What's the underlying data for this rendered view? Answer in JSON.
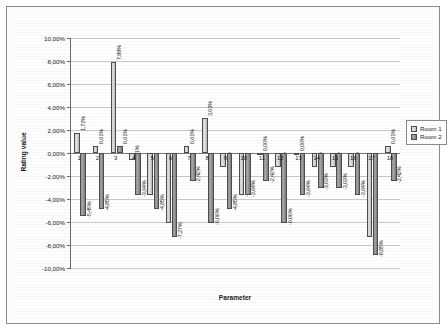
{
  "chart_data": {
    "type": "bar",
    "title": "",
    "xlabel": "Parameter",
    "ylabel": "Rating value",
    "ylim": [
      -10,
      10
    ],
    "ytick_labels": [
      "10,00%",
      "8,00%",
      "6,00%",
      "4,00%",
      "2,00%",
      "0,00%",
      "-2,00%",
      "-4,00%",
      "-6,00%",
      "-8,00%",
      "-10,00%"
    ],
    "ytick_values": [
      10,
      8,
      6,
      4,
      2,
      0,
      -2,
      -4,
      -6,
      -8,
      -10
    ],
    "grid": true,
    "legend_position": "right",
    "categories": [
      "1",
      "2",
      "3",
      "4",
      "5",
      "6",
      "7",
      "8",
      "9",
      "10",
      "11",
      "12",
      "13",
      "14",
      "15",
      "16",
      "17",
      "18"
    ],
    "series": [
      {
        "name": "Room 1",
        "values": [
          1.72,
          0.61,
          7.88,
          -0.61,
          -3.64,
          -6.06,
          0.61,
          3.03,
          -1.21,
          -3.64,
          0.0,
          -1.21,
          0.0,
          -1.21,
          -1.21,
          -1.21,
          -7.27,
          0.61
        ],
        "labels": [
          "1,72%",
          "0,61%",
          "7,88%",
          "-0,61%",
          "-3,64%",
          "-6,06%",
          "0,61%",
          "3,03%",
          "-1,21%",
          "-3,64%",
          "0,00%",
          "-1,21%",
          "0,00%",
          "-1,21%",
          "-1,21%",
          "-1,21%",
          "-7,27%",
          "0,61%"
        ]
      },
      {
        "name": "Room 2",
        "values": [
          -5.45,
          -4.85,
          0.61,
          -3.64,
          -4.85,
          -7.27,
          -2.42,
          -6.06,
          -4.85,
          -3.64,
          -2.42,
          -6.06,
          -3.64,
          -3.03,
          -3.03,
          -3.64,
          -8.85,
          -2.42
        ],
        "labels": [
          "-5,45%",
          "-4,85%",
          "0,61%",
          "-3,64%",
          "-4,85%",
          "-7,27%",
          "-2,42%",
          "-6,06%",
          "-4,85%",
          "-3,64%",
          "-2,42%",
          "-6,06%",
          "-3,64%",
          "-3,03%",
          "-3,03%",
          "-3,64%",
          "-8,85%",
          "-2,42%"
        ]
      }
    ],
    "colors": {
      "series1": "#d4d4d4",
      "series2": "#8f8f8f",
      "grid": "#c9c9c9",
      "axis": "#6b6b6b",
      "text": "#1a1a1a"
    }
  },
  "legend": {
    "items": [
      {
        "label": "Room 1"
      },
      {
        "label": "Room 2"
      }
    ]
  }
}
